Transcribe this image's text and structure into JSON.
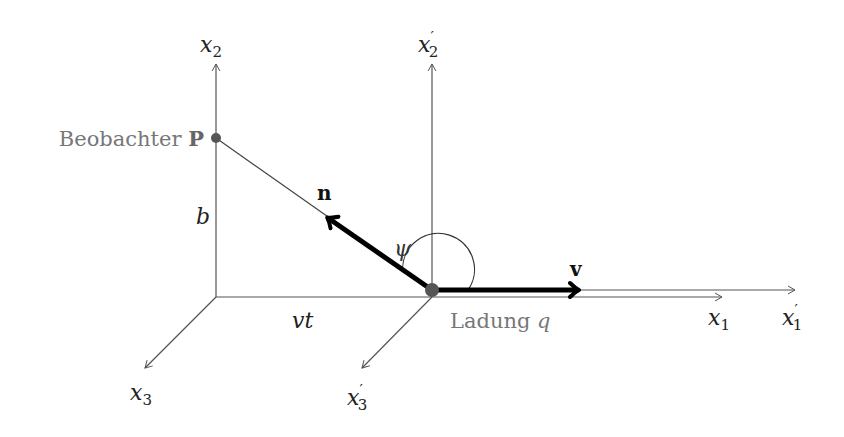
{
  "diagram": {
    "axes": {
      "x1": {
        "base": "x",
        "sub": "1",
        "prime": false
      },
      "x2": {
        "base": "x",
        "sub": "2",
        "prime": false
      },
      "x3": {
        "base": "x",
        "sub": "3",
        "prime": false
      },
      "x1p": {
        "base": "x",
        "sub": "1",
        "prime": true
      },
      "x2p": {
        "base": "x",
        "sub": "2",
        "prime": true
      },
      "x3p": {
        "base": "x",
        "sub": "3",
        "prime": true
      }
    },
    "prime_mark": "′",
    "observer": {
      "label": "Beobachter",
      "symbol": "P"
    },
    "charge": {
      "label": "Ladung",
      "symbol": "q"
    },
    "vectors": {
      "n": "n",
      "v": "v"
    },
    "distances": {
      "b": "b",
      "vt": "vt"
    },
    "angle": {
      "symbol": "ψ"
    },
    "colors": {
      "axis": "#555555",
      "vector": "#000000",
      "point": "#555555",
      "gray_text": "#777777",
      "text": "#222222"
    }
  }
}
